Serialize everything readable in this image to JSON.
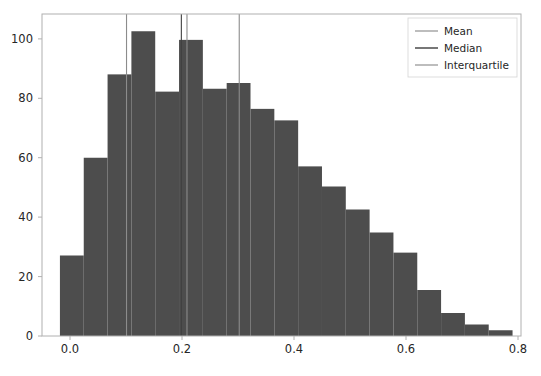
{
  "chart_data": {
    "type": "bar",
    "title": "",
    "subtitle": "",
    "xlabel": "",
    "ylabel": "",
    "xlim": [
      -0.035,
      0.9
    ],
    "ylim": [
      0,
      112
    ],
    "grid": false,
    "bar_color": "#4d4d4d",
    "bin_width": 0.0465,
    "bin_starts": [
      0.0,
      0.0465,
      0.093,
      0.1395,
      0.186,
      0.2325,
      0.279,
      0.3255,
      0.372,
      0.4185,
      0.465,
      0.5115,
      0.558,
      0.6045,
      0.651,
      0.6975,
      0.744,
      0.7905,
      0.837
    ],
    "categories": [
      "0.000",
      "0.047",
      "0.093",
      "0.140",
      "0.186",
      "0.233",
      "0.279",
      "0.326",
      "0.372",
      "0.419",
      "0.465",
      "0.512",
      "0.558",
      "0.605",
      "0.651",
      "0.698",
      "0.744",
      "0.791",
      "0.837"
    ],
    "values": [
      28,
      62,
      91,
      106,
      85,
      103,
      86,
      88,
      79,
      75,
      59,
      52,
      44,
      36,
      29,
      16,
      8,
      4,
      2
    ],
    "xticks": [
      0.0,
      0.2,
      0.4,
      0.6,
      0.8
    ],
    "xticklabels": [
      "0.0",
      "0.2",
      "0.4",
      "0.6",
      "0.8"
    ],
    "yticks": [
      0,
      20,
      40,
      60,
      80,
      100
    ],
    "yticklabels": [
      "0",
      "20",
      "40",
      "60",
      "80",
      "100"
    ],
    "vlines": [
      {
        "name": "interquartile-lower",
        "x": 0.13,
        "color": "#8c8c8c",
        "label": "Interquartile"
      },
      {
        "name": "median",
        "x": 0.237,
        "color": "#404040",
        "label": "Median"
      },
      {
        "name": "mean",
        "x": 0.248,
        "color": "#8c8c8c",
        "label": "Mean"
      },
      {
        "name": "interquartile-upper",
        "x": 0.35,
        "color": "#8c8c8c",
        "label": "Interquartile"
      }
    ],
    "legend": {
      "position": "upper right",
      "entries": [
        {
          "label": "Mean",
          "color": "#9a9a9a"
        },
        {
          "label": "Median",
          "color": "#4a4a4a"
        },
        {
          "label": "Interquartile",
          "color": "#9a9a9a"
        }
      ]
    }
  },
  "axes": {
    "xtick_0": "0.0",
    "xtick_1": "0.2",
    "xtick_2": "0.4",
    "xtick_3": "0.6",
    "xtick_4": "0.8",
    "ytick_0": "0",
    "ytick_1": "20",
    "ytick_2": "40",
    "ytick_3": "60",
    "ytick_4": "80",
    "ytick_5": "100"
  },
  "legend": {
    "entry_0": "Mean",
    "entry_1": "Median",
    "entry_2": "Interquartile"
  },
  "caption": ""
}
